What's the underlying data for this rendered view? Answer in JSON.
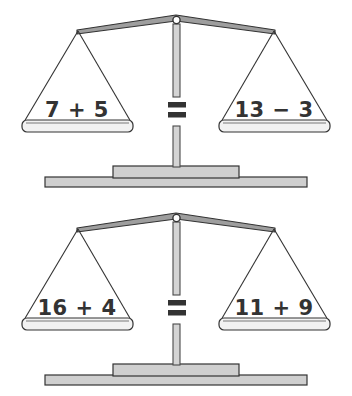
{
  "page": {
    "background_color": "#ffffff"
  },
  "colors": {
    "beam_fill": "#9e9e9e",
    "beam_stroke": "#333333",
    "post_fill": "#d4d4d4",
    "post_stroke": "#4a4a4a",
    "pan_fill": "#f2f2f2",
    "pan_stroke": "#333333",
    "pan_top_edge": "#b5b5b5",
    "base_fill": "#cfcfcf",
    "base_stroke": "#333333",
    "text_color": "#333333",
    "cord_stroke": "#333333"
  },
  "scales": [
    {
      "id": "scale-1",
      "name": "balance-scale-top",
      "left_pan": {
        "name": "pan-left",
        "expression": "7 + 5",
        "terms": [
          "7",
          "+",
          "5"
        ]
      },
      "right_pan": {
        "name": "pan-right",
        "expression": "13 − 3",
        "terms": [
          "13",
          "−",
          "3"
        ]
      },
      "operator": {
        "name": "equals-sign",
        "symbol": "="
      }
    },
    {
      "id": "scale-2",
      "name": "balance-scale-bottom",
      "left_pan": {
        "name": "pan-left",
        "expression": "16 + 4",
        "terms": [
          "16",
          "+",
          "4"
        ]
      },
      "right_pan": {
        "name": "pan-right",
        "expression": "11 + 9",
        "terms": [
          "11",
          "+",
          "9"
        ]
      },
      "operator": {
        "name": "equals-sign",
        "symbol": "="
      }
    }
  ]
}
